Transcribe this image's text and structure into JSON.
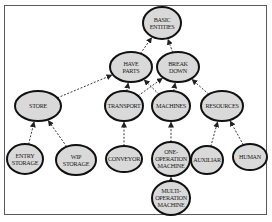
{
  "diagram": {
    "type": "entity hierarchy",
    "colors": {
      "node_fill": "#d9d9d9",
      "node_stroke": "#111111",
      "edge": "#3a3a3a",
      "frame": "#5a5a5a"
    },
    "nodes": [
      {
        "id": "basic-entities",
        "label": "BASIC ENTITIES",
        "lines": [
          "BASIC",
          "ENTITIES"
        ],
        "cx": 162,
        "cy": 23,
        "rx": 19,
        "ry": 16
      },
      {
        "id": "have-parts",
        "label": "HAVE PARTS",
        "lines": [
          "HAVE",
          "PARTS"
        ],
        "cx": 131,
        "cy": 67,
        "rx": 21,
        "ry": 15
      },
      {
        "id": "break-down",
        "label": "BREAK DOWN",
        "lines": [
          "BREAK",
          "DOWN"
        ],
        "cx": 178,
        "cy": 67,
        "rx": 21,
        "ry": 15
      },
      {
        "id": "store",
        "label": "STORE",
        "lines": [
          "STORE"
        ],
        "cx": 38,
        "cy": 106,
        "rx": 23,
        "ry": 15
      },
      {
        "id": "transport",
        "label": "TRANSPORT",
        "lines": [
          "TRANSPORT"
        ],
        "cx": 124,
        "cy": 106,
        "rx": 19,
        "ry": 15
      },
      {
        "id": "machines",
        "label": "MACHINES",
        "lines": [
          "MACHINES"
        ],
        "cx": 171,
        "cy": 106,
        "rx": 19,
        "ry": 15
      },
      {
        "id": "resources",
        "label": "RESOURCES",
        "lines": [
          "RESOURCES"
        ],
        "cx": 222,
        "cy": 106,
        "rx": 21,
        "ry": 15
      },
      {
        "id": "entry-storage",
        "label": "ENTRY STORAGE",
        "lines": [
          "ENTRY",
          "STORAGE"
        ],
        "cx": 25,
        "cy": 159,
        "rx": 18,
        "ry": 15
      },
      {
        "id": "wip-storage",
        "label": "WIP STORAGE",
        "lines": [
          "WIP",
          "STORAGE"
        ],
        "cx": 76,
        "cy": 160,
        "rx": 20,
        "ry": 15
      },
      {
        "id": "conveyor",
        "label": "CONVEYOR",
        "lines": [
          "CONVEYOR"
        ],
        "cx": 124,
        "cy": 159,
        "rx": 18,
        "ry": 13
      },
      {
        "id": "one-operation-machine",
        "label": "ONE-OPERATION MACHINE",
        "lines": [
          "ONE-",
          "OPERATION",
          "MACHINE"
        ],
        "cx": 171,
        "cy": 159,
        "rx": 19,
        "ry": 17
      },
      {
        "id": "auxiliar",
        "label": "AUXILIAR",
        "lines": [
          "AUXILIAR"
        ],
        "cx": 207,
        "cy": 160,
        "rx": 16,
        "ry": 14
      },
      {
        "id": "human",
        "label": "HUMAN",
        "lines": [
          "HUMAN"
        ],
        "cx": 250,
        "cy": 157,
        "rx": 17,
        "ry": 13
      },
      {
        "id": "multi-operation-machine",
        "label": "MULTI-OPERATION MACHINE",
        "lines": [
          "MULTI-",
          "OPERATION",
          "MACHINE"
        ],
        "cx": 171,
        "cy": 198,
        "rx": 19,
        "ry": 17
      }
    ],
    "edges": [
      {
        "from": "have-parts",
        "to": "basic-entities"
      },
      {
        "from": "break-down",
        "to": "basic-entities"
      },
      {
        "from": "store",
        "to": "have-parts"
      },
      {
        "from": "transport",
        "to": "have-parts"
      },
      {
        "from": "machines",
        "to": "have-parts"
      },
      {
        "from": "transport",
        "to": "break-down"
      },
      {
        "from": "machines",
        "to": "break-down"
      },
      {
        "from": "resources",
        "to": "break-down"
      },
      {
        "from": "entry-storage",
        "to": "store"
      },
      {
        "from": "wip-storage",
        "to": "store"
      },
      {
        "from": "conveyor",
        "to": "transport"
      },
      {
        "from": "one-operation-machine",
        "to": "machines"
      },
      {
        "from": "multi-operation-machine",
        "to": "one-operation-machine"
      },
      {
        "from": "auxiliar",
        "to": "resources"
      },
      {
        "from": "human",
        "to": "resources"
      }
    ]
  }
}
